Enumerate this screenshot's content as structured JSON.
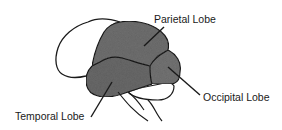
{
  "diagram": {
    "type": "anatomical-brain-lateral-view",
    "labels": {
      "parietal": "Parietal Lobe",
      "occipital": "Occipital Lobe",
      "temporal": "Temporal Lobe"
    },
    "colors": {
      "outline": "#1a1a1a",
      "shaded_lobe": "#6e6e6e",
      "unshaded_region": "#ffffff",
      "background": "#ffffff"
    }
  }
}
